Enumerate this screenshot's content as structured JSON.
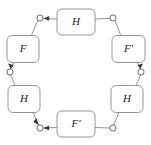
{
  "diagram": {
    "type": "cyclic-functor-diagram",
    "background_color": "#ffffff",
    "box_fill": "#ffffff",
    "box_stroke": "#8a8a8a",
    "line_color": "#8a8a8a",
    "port_stroke": "#5a5a5a",
    "arrow_color": "#3a3a3a",
    "label_color": "#1a1a1a",
    "nodes": [
      {
        "id": "node-top",
        "label": "H",
        "position": "top",
        "cx": 76,
        "cy": 22,
        "w": 38,
        "h": 26
      },
      {
        "id": "node-upper-left",
        "label": "F",
        "position": "upper-left",
        "cx": 23,
        "cy": 49,
        "w": 32,
        "h": 27
      },
      {
        "id": "node-upper-right",
        "label": "F′",
        "position": "upper-right",
        "cx": 128,
        "cy": 49,
        "w": 33,
        "h": 27
      },
      {
        "id": "node-lower-left",
        "label": "H",
        "position": "lower-left",
        "cx": 24,
        "cy": 99,
        "w": 32,
        "h": 27
      },
      {
        "id": "node-lower-right",
        "label": "H",
        "position": "lower-right",
        "cx": 127,
        "cy": 99,
        "w": 32,
        "h": 27
      },
      {
        "id": "node-bottom",
        "label": "F′",
        "position": "bottom",
        "cx": 76,
        "cy": 124,
        "w": 38,
        "h": 26
      }
    ],
    "ports": [
      {
        "id": "port-top-left",
        "cx": 40,
        "cy": 18,
        "r": 3.1,
        "has_arrow": true,
        "arrow_from": "node-top"
      },
      {
        "id": "port-top-right",
        "cx": 113,
        "cy": 18,
        "r": 3.1,
        "has_arrow": false,
        "arrow_from": null
      },
      {
        "id": "port-left-mid",
        "cx": 10,
        "cy": 72,
        "r": 3.1,
        "has_arrow": true,
        "arrow_from": "node-upper-left"
      },
      {
        "id": "port-right-mid",
        "cx": 141,
        "cy": 72,
        "r": 3.1,
        "has_arrow": true,
        "arrow_from": "node-upper-right"
      },
      {
        "id": "port-bottom-left",
        "cx": 40,
        "cy": 128,
        "r": 3.1,
        "has_arrow": true,
        "arrow_from": "node-bottom"
      },
      {
        "id": "port-bottom-right",
        "cx": 113,
        "cy": 128,
        "r": 3.1,
        "has_arrow": false,
        "arrow_from": null
      }
    ],
    "edges": [
      {
        "id": "edge-top-to-port-top-left",
        "from": "node-top",
        "to": "port-top-left",
        "arrowhead": true
      },
      {
        "id": "edge-port-top-left-to-upper-left",
        "from": "port-top-left",
        "to": "node-upper-left",
        "arrowhead": false
      },
      {
        "id": "edge-top-to-port-top-right",
        "from": "node-top",
        "to": "port-top-right",
        "arrowhead": false
      },
      {
        "id": "edge-port-top-right-to-upper-right",
        "from": "port-top-right",
        "to": "node-upper-right",
        "arrowhead": false
      },
      {
        "id": "edge-upper-left-to-port-left-mid",
        "from": "node-upper-left",
        "to": "port-left-mid",
        "arrowhead": true
      },
      {
        "id": "edge-port-left-mid-to-lower-left",
        "from": "port-left-mid",
        "to": "node-lower-left",
        "arrowhead": false
      },
      {
        "id": "edge-upper-right-to-port-right-mid",
        "from": "node-upper-right",
        "to": "port-right-mid",
        "arrowhead": true
      },
      {
        "id": "edge-port-right-mid-to-lower-right",
        "from": "port-right-mid",
        "to": "node-lower-right",
        "arrowhead": false
      },
      {
        "id": "edge-lower-left-to-port-bottom-left",
        "from": "node-lower-left",
        "to": "port-bottom-left",
        "arrowhead": true
      },
      {
        "id": "edge-bottom-to-port-bottom-left",
        "from": "node-bottom",
        "to": "port-bottom-left",
        "arrowhead": true
      },
      {
        "id": "edge-lower-right-to-port-bottom-right",
        "from": "node-lower-right",
        "to": "port-bottom-right",
        "arrowhead": false
      },
      {
        "id": "edge-port-bottom-right-to-bottom",
        "from": "port-bottom-right",
        "to": "node-bottom",
        "arrowhead": false
      }
    ]
  }
}
